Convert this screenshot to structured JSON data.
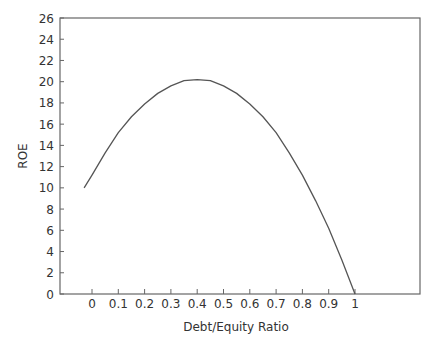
{
  "chart_data": {
    "type": "line",
    "title": "",
    "xlabel": "Debt/Equity Ratio",
    "ylabel": "ROE",
    "xlim": [
      -0.1,
      1.1
    ],
    "ylim": [
      0,
      26
    ],
    "x_ticks": [
      "0",
      "0.1",
      "0.2",
      "0.3",
      "0.4",
      "0.5",
      "0.6",
      "0.7",
      "0.8",
      "0.9",
      "1"
    ],
    "y_ticks": [
      "0",
      "2",
      "4",
      "6",
      "8",
      "10",
      "12",
      "14",
      "16",
      "18",
      "20",
      "22",
      "24",
      "26"
    ],
    "grid": false,
    "legend": null,
    "series": [
      {
        "name": "ROE",
        "color": "#555555",
        "x": [
          -0.03,
          0.0,
          0.05,
          0.1,
          0.15,
          0.2,
          0.25,
          0.3,
          0.35,
          0.4,
          0.45,
          0.5,
          0.55,
          0.6,
          0.65,
          0.7,
          0.75,
          0.8,
          0.85,
          0.9,
          0.95,
          1.0
        ],
        "values": [
          10.0,
          11.2,
          13.3,
          15.2,
          16.7,
          17.9,
          18.9,
          19.6,
          20.1,
          20.2,
          20.1,
          19.6,
          18.9,
          17.9,
          16.7,
          15.2,
          13.3,
          11.2,
          8.8,
          6.2,
          3.2,
          0.0
        ]
      }
    ]
  }
}
